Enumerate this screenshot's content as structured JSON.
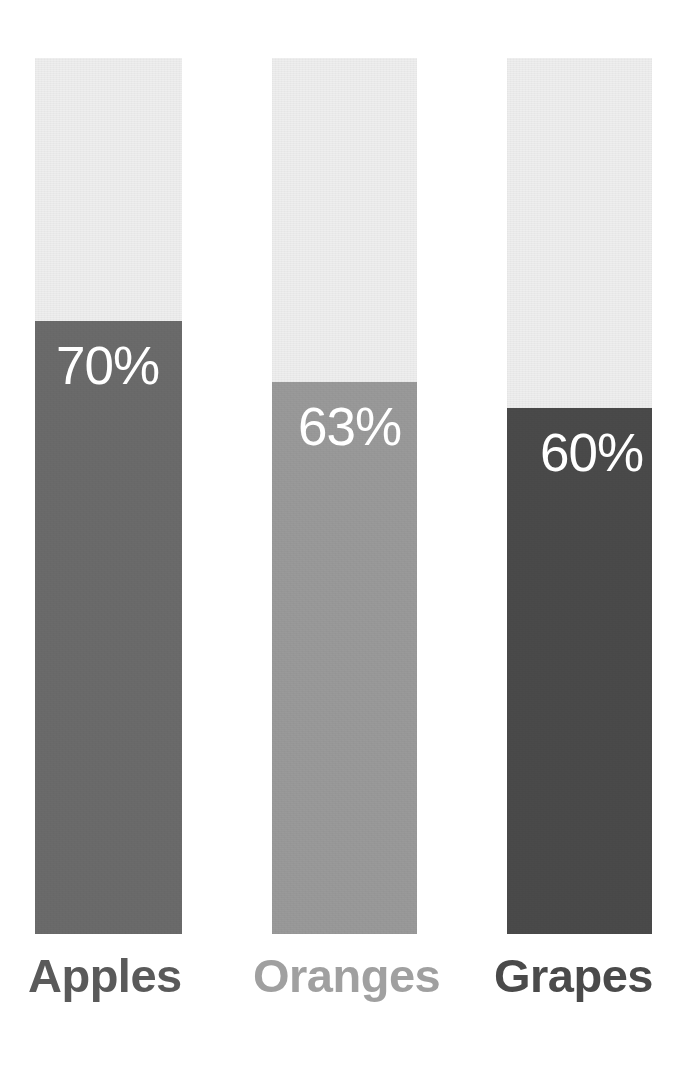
{
  "chart_data": {
    "type": "bar",
    "orientation": "vertical",
    "style": "progress-bars",
    "title": "",
    "subtitle": "",
    "xlabel": "",
    "ylabel": "",
    "ylim": [
      0,
      100
    ],
    "grid": false,
    "legend": "none",
    "unit": "%",
    "background_color": "#ffffff",
    "track_color": "#ededed",
    "value_label_color": "#ffffff",
    "categories": [
      "Apples",
      "Oranges",
      "Grapes"
    ],
    "values": [
      70,
      63,
      60
    ],
    "value_labels": [
      "70%",
      "63%",
      "60%"
    ],
    "bar_colors": [
      "#6b6b6b",
      "#9a9a9a",
      "#4a4a4a"
    ],
    "label_colors": [
      "#5a5a5a",
      "#a0a0a0",
      "#4a4a4a"
    ],
    "bars": [
      {
        "category": "Apples",
        "value": 70,
        "value_label": "70%",
        "fill_color": "#6b6b6b",
        "label_color": "#5a5a5a"
      },
      {
        "category": "Oranges",
        "value": 63,
        "value_label": "63%",
        "fill_color": "#9a9a9a",
        "label_color": "#a0a0a0"
      },
      {
        "category": "Grapes",
        "value": 60,
        "value_label": "60%",
        "fill_color": "#4a4a4a",
        "label_color": "#4a4a4a"
      }
    ]
  }
}
